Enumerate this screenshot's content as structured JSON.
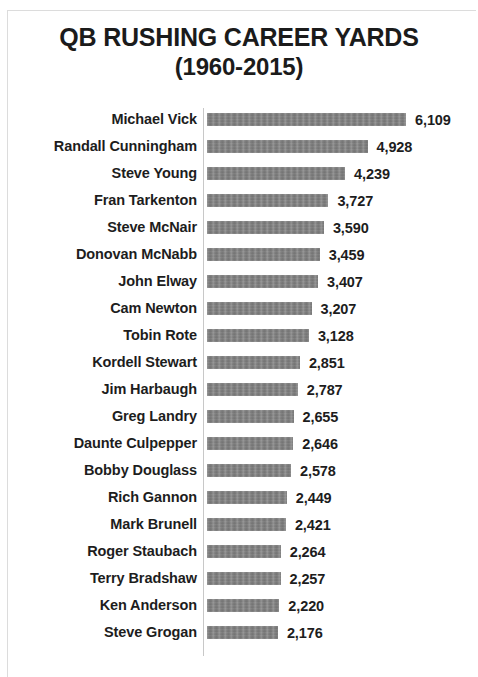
{
  "chart_data": {
    "type": "bar",
    "orientation": "horizontal",
    "title": "QB RUSHING CAREER YARDS",
    "subtitle": "(1960-2015)",
    "xlabel": "",
    "ylabel": "",
    "xlim": [
      0,
      6109
    ],
    "grid": false,
    "legend": false,
    "bar_color": "#7c7c7c",
    "text_color": "#1d1d1d",
    "axis_color": "#c8c8c8",
    "value_labels_shown": true,
    "categories": [
      "Michael Vick",
      "Randall Cunningham",
      "Steve Young",
      "Fran Tarkenton",
      "Steve McNair",
      "Donovan McNabb",
      "John Elway",
      "Cam Newton",
      "Tobin Rote",
      "Kordell Stewart",
      "Jim Harbaugh",
      "Greg Landry",
      "Daunte Culpepper",
      "Bobby Douglass",
      "Rich Gannon",
      "Mark Brunell",
      "Roger Staubach",
      "Terry Bradshaw",
      "Ken Anderson",
      "Steve Grogan"
    ],
    "values": [
      6109,
      4928,
      4239,
      3727,
      3590,
      3459,
      3407,
      3207,
      3128,
      2851,
      2787,
      2655,
      2646,
      2578,
      2449,
      2421,
      2264,
      2257,
      2220,
      2176
    ],
    "value_labels": [
      "6,109",
      "4,928",
      "4,239",
      "3,727",
      "3,590",
      "3,459",
      "3,407",
      "3,207",
      "3,128",
      "2,851",
      "2,787",
      "2,655",
      "2,646",
      "2,578",
      "2,449",
      "2,421",
      "2,264",
      "2,257",
      "2,220",
      "2,176"
    ]
  }
}
